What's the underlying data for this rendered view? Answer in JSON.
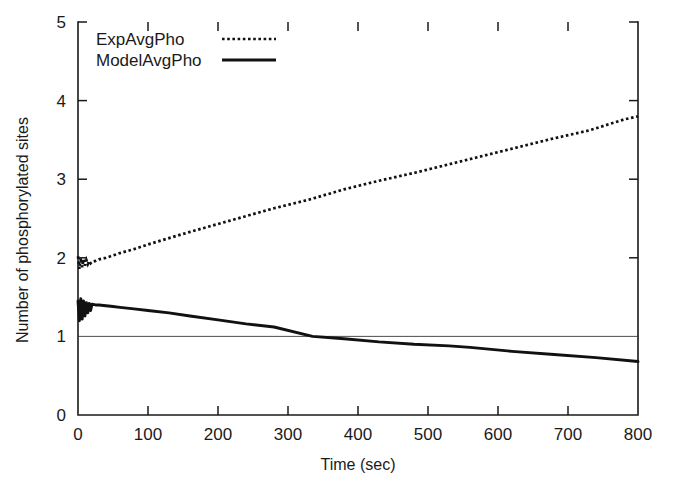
{
  "chart_data": {
    "type": "line",
    "title": "",
    "xlabel": "Time (sec)",
    "ylabel": "Number of phosphorylated sites",
    "xlim": [
      0,
      800
    ],
    "ylim": [
      0,
      5
    ],
    "xticks": [
      0,
      100,
      200,
      300,
      400,
      500,
      600,
      700,
      800
    ],
    "yticks": [
      0,
      1,
      2,
      3,
      4,
      5
    ],
    "xticklabels": [
      "0",
      "100",
      "200",
      "300",
      "400",
      "500",
      "600",
      "700",
      "800"
    ],
    "yticklabels": [
      "0",
      "1",
      "2",
      "3",
      "4",
      "5"
    ],
    "grid": false,
    "reference_lines": [
      {
        "name": "baseline-one",
        "axis": "y",
        "value": 1,
        "style": "thin-solid"
      }
    ],
    "legend_position": "top-left inside",
    "series": [
      {
        "name": "ExpAvgPho",
        "style": "dotted",
        "color": "#111111",
        "x": [
          0,
          2,
          4,
          6,
          8,
          10,
          12,
          14,
          16,
          18,
          20,
          25,
          30,
          40,
          50,
          60,
          80,
          100,
          130,
          160,
          200,
          240,
          280,
          330,
          380,
          430,
          480,
          530,
          580,
          630,
          680,
          730,
          780,
          800
        ],
        "y": [
          2.02,
          1.86,
          2.0,
          1.88,
          1.98,
          1.9,
          1.97,
          1.92,
          1.96,
          1.93,
          1.95,
          1.96,
          1.98,
          2.0,
          2.03,
          2.06,
          2.11,
          2.17,
          2.25,
          2.33,
          2.43,
          2.53,
          2.63,
          2.74,
          2.87,
          2.98,
          3.08,
          3.19,
          3.3,
          3.41,
          3.52,
          3.62,
          3.76,
          3.8
        ]
      },
      {
        "name": "ModelAvgPho",
        "style": "solid",
        "color": "#111111",
        "x": [
          0,
          2,
          4,
          6,
          8,
          10,
          12,
          14,
          16,
          18,
          20,
          25,
          30,
          40,
          50,
          60,
          80,
          100,
          130,
          160,
          200,
          240,
          280,
          335,
          380,
          430,
          480,
          530,
          560,
          620,
          680,
          740,
          800
        ],
        "y": [
          1.45,
          1.2,
          1.48,
          1.22,
          1.45,
          1.26,
          1.43,
          1.3,
          1.42,
          1.33,
          1.41,
          1.4,
          1.4,
          1.39,
          1.38,
          1.37,
          1.35,
          1.33,
          1.3,
          1.26,
          1.21,
          1.16,
          1.12,
          1.0,
          0.97,
          0.93,
          0.9,
          0.88,
          0.86,
          0.81,
          0.77,
          0.73,
          0.68
        ]
      }
    ],
    "annotations": []
  },
  "legend": {
    "entries": [
      {
        "label": "ExpAvgPho",
        "marker": "dotted-line"
      },
      {
        "label": "ModelAvgPho",
        "marker": "solid-line"
      }
    ]
  }
}
